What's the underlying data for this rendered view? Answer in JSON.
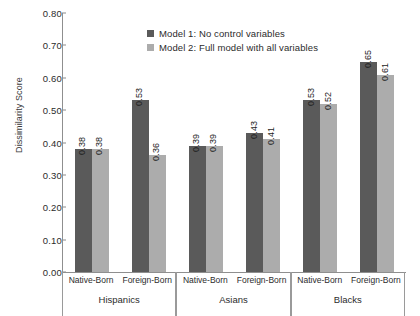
{
  "chart_data": {
    "type": "bar",
    "title": "",
    "xlabel": "",
    "ylabel": "Dissimilarity Score",
    "ylim": [
      0.0,
      0.8
    ],
    "ytick_labels": [
      "0.00",
      "0.10",
      "0.20",
      "0.30",
      "0.40",
      "0.50",
      "0.60",
      "0.70",
      "0.80"
    ],
    "ytick_values": [
      0.0,
      0.1,
      0.2,
      0.3,
      0.4,
      0.5,
      0.6,
      0.7,
      0.8
    ],
    "grid": false,
    "legend_position": "top-center",
    "groups": [
      "Hispanics",
      "Asians",
      "Blacks"
    ],
    "subcategories": [
      "Native-Born",
      "Foreign-Born"
    ],
    "categories": [
      "Hispanics / Native-Born",
      "Hispanics / Foreign-Born",
      "Asians / Native-Born",
      "Asians / Foreign-Born",
      "Blacks / Native-Born",
      "Blacks / Foreign-Born"
    ],
    "series": [
      {
        "name": "Model 1: No control variables",
        "color": "#5a5a5a",
        "values": [
          0.38,
          0.53,
          0.39,
          0.43,
          0.53,
          0.65
        ],
        "labels": [
          "0.38",
          "0.53",
          "0.39",
          "0.43",
          "0.53",
          "0.65"
        ]
      },
      {
        "name": "Model 2: Full model with all variables",
        "color": "#acacac",
        "values": [
          0.38,
          0.36,
          0.39,
          0.41,
          0.52,
          0.61
        ],
        "labels": [
          "0.38",
          "0.36",
          "0.39",
          "0.41",
          "0.52",
          "0.61"
        ]
      }
    ]
  },
  "legend": {
    "items": [
      {
        "label": "Model 1: No control variables",
        "color": "#5a5a5a"
      },
      {
        "label": "Model 2: Full model with all variables",
        "color": "#acacac"
      }
    ]
  },
  "axis": {
    "y_title": "Dissimilarity Score"
  }
}
